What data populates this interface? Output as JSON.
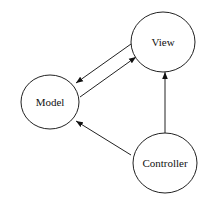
{
  "diagram": {
    "nodes": [
      {
        "id": "model",
        "label": "Model"
      },
      {
        "id": "view",
        "label": "View"
      },
      {
        "id": "controller",
        "label": "Controller"
      }
    ],
    "edges": [
      {
        "from": "view",
        "to": "model"
      },
      {
        "from": "model",
        "to": "view"
      },
      {
        "from": "controller",
        "to": "view"
      },
      {
        "from": "controller",
        "to": "model"
      }
    ],
    "colors": {
      "stroke": "#222222",
      "fill": "#ffffff",
      "text": "#111111"
    }
  }
}
